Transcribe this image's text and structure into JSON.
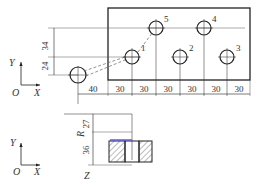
{
  "top_view": {
    "axis": {
      "y_label": "Y",
      "x_label": "X",
      "origin_label": "O"
    },
    "vertical_dims": [
      "34",
      "24"
    ],
    "horizontal_dims": [
      "40",
      "30",
      "30",
      "30",
      "30",
      "30",
      "30"
    ],
    "hole_labels": [
      "1",
      "2",
      "3",
      "4",
      "5"
    ]
  },
  "side_view": {
    "axis": {
      "y_label": "Y",
      "x_label": "X",
      "origin_label": "O"
    },
    "dims": [
      "27",
      "36"
    ],
    "plane_labels": {
      "r": "R",
      "z": "Z"
    }
  },
  "colors": {
    "line": "#222222",
    "highlight": "#5b5bd6",
    "hatch": "#444444"
  }
}
